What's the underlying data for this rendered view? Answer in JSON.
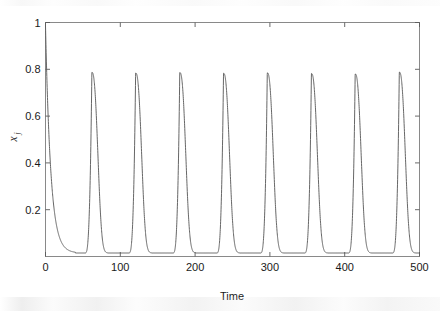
{
  "figure": {
    "name": "time-series-oscillation-plot",
    "background": "#ffffff",
    "curve_color": "#5e5e5e",
    "axis_color": "#7d7d7d"
  },
  "axes": {
    "x_title": "Time",
    "y_title_base": "x",
    "y_title_subscript": "j",
    "x_tick_labels": [
      "0",
      "100",
      "200",
      "300",
      "400",
      "500"
    ],
    "x_tick_values": [
      0,
      100,
      200,
      300,
      400,
      500
    ],
    "y_tick_labels": [
      "0.2",
      "0.4",
      "0.6",
      "0.8",
      "1"
    ],
    "y_tick_values": [
      0.2,
      0.4,
      0.6,
      0.8,
      1
    ]
  },
  "chart_data": {
    "type": "line",
    "title": "",
    "subtitle": "",
    "xlabel": "Time",
    "ylabel": "x_j",
    "xlim": [
      0,
      500
    ],
    "ylim": [
      0,
      1
    ],
    "grid": false,
    "legend": false,
    "legend_position": "none",
    "annotations": [],
    "initial_value": 0.985,
    "baseline_value": 0.015,
    "peak_value": 0.785,
    "period": 58.7,
    "peak_times": [
      62,
      120.5,
      179.5,
      238,
      296.5,
      355.5,
      414,
      473
    ],
    "peak_values": [
      0.787,
      0.784,
      0.786,
      0.783,
      0.785,
      0.782,
      0.78,
      0.788
    ],
    "trough_times": [
      40,
      98,
      157,
      216,
      274,
      333,
      392,
      450
    ],
    "trough_values": [
      0.012,
      0.012,
      0.012,
      0.012,
      0.012,
      0.012,
      0.012,
      0.012
    ],
    "series": [
      {
        "name": "x_j",
        "color": "#5e5e5e",
        "style": "solid",
        "width": 0.95
      }
    ]
  }
}
